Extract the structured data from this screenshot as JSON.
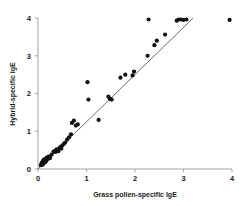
{
  "chart_data": {
    "type": "scatter",
    "title": "",
    "subtitle": "",
    "xlabel": "Grass pollen-specific IgE",
    "ylabel": "Hybrid-specific IgE",
    "xlim": [
      0,
      4.15
    ],
    "ylim": [
      0,
      4.15
    ],
    "xticks": [
      0,
      1,
      2,
      3,
      4
    ],
    "yticks": [
      0,
      1,
      2,
      3,
      4
    ],
    "xticklabels": [
      "0",
      "1",
      "2",
      "3",
      "4"
    ],
    "yticklabels": [
      "0",
      "1",
      "2",
      "3",
      "4"
    ],
    "grid": false,
    "legend": null,
    "legend_position": "none",
    "marker": "filled-circle",
    "marker_color": "#111111",
    "marker_size_px": 2.1,
    "n_points": 55,
    "reference_line": {
      "label": "",
      "type": "linear-fit",
      "x_start": 0.0,
      "y_start": 0.0,
      "x_end": 3.2,
      "y_end": 4.0,
      "slope": 1.25,
      "intercept": 0.0,
      "color": "#3a3a3a"
    },
    "points": [
      [
        0.06,
        0.1
      ],
      [
        0.07,
        0.13
      ],
      [
        0.08,
        0.11
      ],
      [
        0.08,
        0.17
      ],
      [
        0.09,
        0.14
      ],
      [
        0.1,
        0.19
      ],
      [
        0.1,
        0.12
      ],
      [
        0.11,
        0.22
      ],
      [
        0.12,
        0.16
      ],
      [
        0.12,
        0.25
      ],
      [
        0.13,
        0.2
      ],
      [
        0.14,
        0.24
      ],
      [
        0.15,
        0.18
      ],
      [
        0.16,
        0.27
      ],
      [
        0.17,
        0.22
      ],
      [
        0.18,
        0.3
      ],
      [
        0.2,
        0.26
      ],
      [
        0.22,
        0.33
      ],
      [
        0.25,
        0.29
      ],
      [
        0.28,
        0.38
      ],
      [
        0.32,
        0.46
      ],
      [
        0.34,
        0.47
      ],
      [
        0.36,
        0.45
      ],
      [
        0.38,
        0.52
      ],
      [
        0.4,
        0.48
      ],
      [
        0.42,
        0.47
      ],
      [
        0.44,
        0.55
      ],
      [
        0.46,
        0.58
      ],
      [
        0.48,
        0.54
      ],
      [
        0.5,
        0.62
      ],
      [
        0.53,
        0.66
      ],
      [
        0.56,
        0.7
      ],
      [
        0.6,
        0.78
      ],
      [
        0.64,
        0.84
      ],
      [
        0.68,
        0.92
      ],
      [
        0.7,
        1.22
      ],
      [
        0.74,
        1.28
      ],
      [
        0.78,
        1.15
      ],
      [
        0.82,
        1.18
      ],
      [
        1.02,
        2.3
      ],
      [
        1.04,
        1.84
      ],
      [
        1.25,
        1.3
      ],
      [
        1.45,
        1.92
      ],
      [
        1.48,
        1.86
      ],
      [
        1.52,
        1.84
      ],
      [
        1.7,
        2.42
      ],
      [
        1.8,
        2.5
      ],
      [
        1.95,
        2.48
      ],
      [
        1.98,
        2.58
      ],
      [
        2.26,
        3.0
      ],
      [
        2.28,
        3.96
      ],
      [
        2.4,
        3.28
      ],
      [
        2.45,
        3.4
      ],
      [
        2.62,
        3.56
      ],
      [
        2.86,
        3.93
      ],
      [
        2.9,
        3.96
      ],
      [
        2.95,
        3.96
      ],
      [
        3.0,
        3.95
      ],
      [
        3.06,
        3.96
      ],
      [
        3.95,
        3.95
      ]
    ]
  },
  "axes": {
    "x_axis_name": "x-axis",
    "y_axis_name": "y-axis"
  }
}
